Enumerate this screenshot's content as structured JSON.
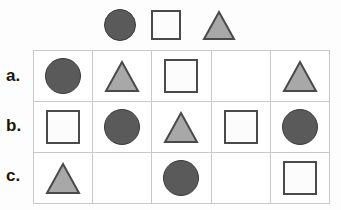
{
  "colors": {
    "circle_fill": "#5a5a5a",
    "circle_stroke": "#3b3b3b",
    "square_fill": "#fcfcfc",
    "square_stroke": "#4a4a4a",
    "triangle_fill": "#a8a8a8",
    "triangle_stroke": "#4a4a4a",
    "grid_line": "#c9c9c9",
    "background": "#fdfdfd",
    "label_text": "#161616"
  },
  "key_row": {
    "name": "shape-key",
    "shapes": [
      {
        "type": "circle",
        "icon": "circle-icon",
        "shade": "dark-gray"
      },
      {
        "type": "square",
        "icon": "square-icon",
        "shade": "white"
      },
      {
        "type": "triangle",
        "icon": "triangle-icon",
        "shade": "light-gray"
      }
    ]
  },
  "table": {
    "row_count": 3,
    "column_count": 5,
    "row_labels": [
      "a.",
      "b.",
      "c."
    ],
    "rows": [
      {
        "label": "a.",
        "cells": [
          "circle",
          "triangle",
          "square",
          "",
          "triangle"
        ]
      },
      {
        "label": "b.",
        "cells": [
          "square",
          "circle",
          "triangle",
          "square",
          "circle"
        ]
      },
      {
        "label": "c.",
        "cells": [
          "triangle",
          "",
          "circle",
          "",
          "square"
        ]
      }
    ]
  }
}
